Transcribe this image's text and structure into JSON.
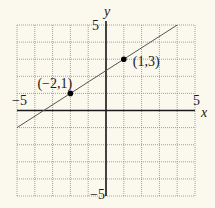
{
  "chart_data": {
    "type": "line",
    "title": "",
    "xlabel": "x",
    "ylabel": "y",
    "xlim": [
      -5,
      5
    ],
    "ylim": [
      -5,
      5
    ],
    "grid": true,
    "grid_style": "dotted",
    "x_tick_labels": {
      "min": "−5",
      "max": "5"
    },
    "y_tick_labels": {
      "min": "−5",
      "max": "5"
    },
    "series": [
      {
        "name": "line",
        "equation": "y = (2/3)x + 7/3",
        "slope": 0.6667,
        "intercept": 2.3333,
        "x": [
          -5,
          4
        ],
        "y": [
          -1,
          5
        ]
      }
    ],
    "points": [
      {
        "x": -2,
        "y": 1,
        "label": "(−2,1)"
      },
      {
        "x": 1,
        "y": 3,
        "label": "(1,3)"
      }
    ],
    "colors": {
      "background": "#fbf8ee",
      "grid": "#8a8a8a",
      "axis": "#1a1a1a",
      "line": "#555555",
      "point": "#000000"
    }
  }
}
